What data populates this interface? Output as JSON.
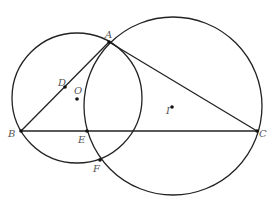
{
  "diagram": {
    "title": "",
    "colors": {
      "stroke": "#222222",
      "point": "#111111",
      "label": "#555555",
      "background": "#ffffff"
    },
    "points": {
      "A": {
        "label": "A",
        "x": 109,
        "y": 42,
        "lx": 105,
        "ly": 38
      },
      "B": {
        "label": "B",
        "x": 21,
        "y": 131,
        "lx": 8,
        "ly": 137
      },
      "C": {
        "label": "C",
        "x": 257,
        "y": 131,
        "lx": 259,
        "ly": 137
      },
      "D": {
        "label": "D",
        "x": 65,
        "y": 87,
        "lx": 58,
        "ly": 86
      },
      "E": {
        "label": "E",
        "x": 87,
        "y": 131,
        "lx": 78,
        "ly": 143
      },
      "F": {
        "label": "F",
        "x": 100,
        "y": 160,
        "lx": 93,
        "ly": 172
      },
      "O": {
        "label": "O",
        "x": 77,
        "y": 99,
        "lx": 74,
        "ly": 94
      },
      "I": {
        "label": "I",
        "x": 172,
        "y": 107,
        "lx": 166,
        "ly": 114
      }
    },
    "circles": [
      {
        "name": "circle-O",
        "center": "O",
        "cx": 77,
        "cy": 98,
        "r": 65
      },
      {
        "name": "circle-I",
        "center": "I",
        "cx": 173,
        "cy": 106,
        "r": 89
      }
    ],
    "segments": [
      {
        "name": "segment-AB",
        "from": "A",
        "to": "B"
      },
      {
        "name": "segment-AC",
        "from": "A",
        "to": "C"
      },
      {
        "name": "segment-BC",
        "from": "B",
        "to": "C"
      }
    ]
  }
}
